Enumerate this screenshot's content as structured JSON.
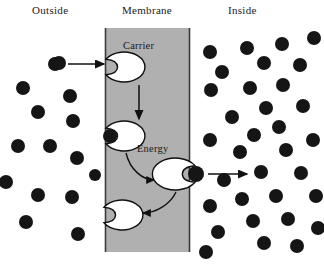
{
  "figure": {
    "title_outside": "Outside",
    "title_membrane": "Membrane",
    "title_inside": "Inside",
    "carrier_label": "Carrier",
    "energy_label": "Energy"
  },
  "colors": {
    "membrane_fill": "#b0b0b0",
    "membrane_edge": "#3a3a3a",
    "particle": "#151515",
    "carrier_fill": "#ffffff",
    "carrier_stroke": "#111111",
    "background": "#ffffff",
    "text": "#1a1a1a"
  },
  "membrane": {
    "x_left": 105,
    "x_right": 190,
    "y_top": 28,
    "y_bottom": 252
  },
  "chart_data": {
    "type": "diagram",
    "outside_particle_count": 14,
    "inside_particle_count": 33,
    "gradient_direction": "outside (low concentration) to inside (high concentration)"
  },
  "labels": [
    {
      "text": "Outside",
      "x": 32,
      "y": 14
    },
    {
      "text": "Membrane",
      "x": 122,
      "y": 14
    },
    {
      "text": "Inside",
      "x": 228,
      "y": 14
    }
  ],
  "inline_labels": [
    {
      "text": "Carrier",
      "x": 123,
      "y": 49
    },
    {
      "text": "Energy",
      "x": 137,
      "y": 152
    }
  ],
  "carriers": [
    {
      "id": "carrier-top",
      "cx": 127,
      "cy": 67,
      "rx": 21,
      "ry": 15,
      "notch_side": "left",
      "loaded": false
    },
    {
      "id": "carrier-middle-left",
      "cx": 127,
      "cy": 136,
      "rx": 21,
      "ry": 15,
      "notch_side": "left",
      "loaded": true
    },
    {
      "id": "carrier-energized",
      "cx": 172,
      "cy": 174,
      "rx": 23,
      "ry": 16,
      "notch_side": "right",
      "loaded": true
    },
    {
      "id": "carrier-bottom",
      "cx": 125,
      "cy": 215,
      "rx": 21,
      "ry": 15,
      "notch_side": "left",
      "loaded": false
    }
  ],
  "outside_particles": [
    {
      "cx": 59,
      "cy": 63,
      "r": 7
    },
    {
      "cx": 23,
      "cy": 88,
      "r": 7
    },
    {
      "cx": 70,
      "cy": 96,
      "r": 7
    },
    {
      "cx": 38,
      "cy": 112,
      "r": 7
    },
    {
      "cx": 73,
      "cy": 121,
      "r": 7
    },
    {
      "cx": 18,
      "cy": 146,
      "r": 7
    },
    {
      "cx": 50,
      "cy": 146,
      "r": 7
    },
    {
      "cx": 77,
      "cy": 158,
      "r": 7
    },
    {
      "cx": 38,
      "cy": 195,
      "r": 7
    },
    {
      "cx": 72,
      "cy": 197,
      "r": 7
    },
    {
      "cx": 26,
      "cy": 222,
      "r": 7
    },
    {
      "cx": 78,
      "cy": 234,
      "r": 7
    },
    {
      "cx": 6,
      "cy": 182,
      "r": 7
    },
    {
      "cx": 95,
      "cy": 175,
      "r": 6
    }
  ],
  "inside_particles": [
    {
      "cx": 247,
      "cy": 48,
      "r": 7
    },
    {
      "cx": 282,
      "cy": 44,
      "r": 7
    },
    {
      "cx": 314,
      "cy": 38,
      "r": 7
    },
    {
      "cx": 210,
      "cy": 52,
      "r": 7
    },
    {
      "cx": 264,
      "cy": 63,
      "r": 7
    },
    {
      "cx": 300,
      "cy": 65,
      "r": 7
    },
    {
      "cx": 222,
      "cy": 72,
      "r": 7
    },
    {
      "cx": 250,
      "cy": 88,
      "r": 7
    },
    {
      "cx": 283,
      "cy": 85,
      "r": 7
    },
    {
      "cx": 211,
      "cy": 90,
      "r": 7
    },
    {
      "cx": 266,
      "cy": 108,
      "r": 7
    },
    {
      "cx": 303,
      "cy": 106,
      "r": 7
    },
    {
      "cx": 232,
      "cy": 117,
      "r": 7
    },
    {
      "cx": 279,
      "cy": 127,
      "r": 7
    },
    {
      "cx": 254,
      "cy": 135,
      "r": 7
    },
    {
      "cx": 210,
      "cy": 140,
      "r": 7
    },
    {
      "cx": 240,
      "cy": 152,
      "r": 7
    },
    {
      "cx": 286,
      "cy": 150,
      "r": 7
    },
    {
      "cx": 313,
      "cy": 140,
      "r": 7
    },
    {
      "cx": 261,
      "cy": 172,
      "r": 7
    },
    {
      "cx": 301,
      "cy": 173,
      "r": 7
    },
    {
      "cx": 224,
      "cy": 180,
      "r": 7
    },
    {
      "cx": 316,
      "cy": 196,
      "r": 7
    },
    {
      "cx": 242,
      "cy": 199,
      "r": 7
    },
    {
      "cx": 276,
      "cy": 196,
      "r": 7
    },
    {
      "cx": 210,
      "cy": 206,
      "r": 7
    },
    {
      "cx": 253,
      "cy": 221,
      "r": 7
    },
    {
      "cx": 288,
      "cy": 219,
      "r": 7
    },
    {
      "cx": 218,
      "cy": 232,
      "r": 7
    },
    {
      "cx": 264,
      "cy": 243,
      "r": 7
    },
    {
      "cx": 297,
      "cy": 246,
      "r": 7
    },
    {
      "cx": 206,
      "cy": 252,
      "r": 7
    },
    {
      "cx": 318,
      "cy": 228,
      "r": 7
    }
  ],
  "bound_particles": [
    {
      "id": "bound-middle-left",
      "cx": 110,
      "cy": 136,
      "r": 7
    },
    {
      "id": "released-particle",
      "cx": 196,
      "cy": 174,
      "r": 8
    }
  ],
  "free_particles": [
    {
      "id": "entering-particle",
      "cx": 55,
      "cy": 64,
      "r": 7
    }
  ],
  "arrows": [
    {
      "id": "arrow-uptake",
      "type": "straight",
      "x1": 68,
      "y1": 64,
      "x2": 104,
      "y2": 64
    },
    {
      "id": "arrow-translocation",
      "type": "straight",
      "x1": 139,
      "y1": 85,
      "x2": 139,
      "y2": 119
    },
    {
      "id": "arrow-release",
      "type": "straight",
      "x1": 208,
      "y1": 174,
      "x2": 247,
      "y2": 174
    },
    {
      "id": "arrow-energy-input",
      "type": "curve",
      "path": "M 126,153 C 130,170 143,180 154,180"
    },
    {
      "id": "arrow-recycle",
      "type": "curve",
      "path": "M 176,192 C 170,205 155,213 143,213"
    }
  ]
}
